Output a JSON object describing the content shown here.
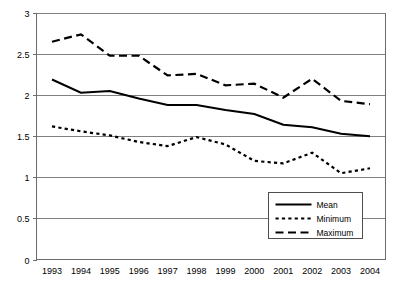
{
  "chart_data": {
    "type": "line",
    "title": "",
    "xlabel": "",
    "ylabel": "",
    "categories": [
      "1993",
      "1994",
      "1995",
      "1996",
      "1997",
      "1998",
      "1999",
      "2000",
      "2001",
      "2002",
      "2003",
      "2004"
    ],
    "x": [
      1993,
      1994,
      1995,
      1996,
      1997,
      1998,
      1999,
      2000,
      2001,
      2002,
      2003,
      2004
    ],
    "ylim": [
      0,
      3
    ],
    "xlim": [
      1993,
      2004
    ],
    "yticks": [
      "0",
      "0.5",
      "1",
      "1.5",
      "2",
      "2.5",
      "3"
    ],
    "ytick_values": [
      0,
      0.5,
      1,
      1.5,
      2,
      2.5,
      3
    ],
    "grid": "horizontal",
    "legend_position": "bottom-right",
    "series": [
      {
        "name": "Mean",
        "style": "solid",
        "color": "#000000",
        "values": [
          2.19,
          2.03,
          2.05,
          1.96,
          1.88,
          1.88,
          1.82,
          1.77,
          1.64,
          1.61,
          1.53,
          1.5
        ]
      },
      {
        "name": "Minimum",
        "style": "dotted",
        "color": "#000000",
        "values": [
          1.62,
          1.56,
          1.51,
          1.43,
          1.38,
          1.49,
          1.4,
          1.2,
          1.17,
          1.3,
          1.05,
          1.11
        ]
      },
      {
        "name": "Maximum",
        "style": "dashed",
        "color": "#000000",
        "values": [
          2.65,
          2.74,
          2.48,
          2.48,
          2.24,
          2.26,
          2.12,
          2.14,
          1.97,
          2.2,
          1.93,
          1.89
        ]
      }
    ]
  },
  "legend": {
    "items": [
      {
        "label": "Mean",
        "style": "solid"
      },
      {
        "label": "Minimum",
        "style": "dotted"
      },
      {
        "label": "Maximum",
        "style": "dashed"
      }
    ]
  },
  "axes": {
    "y_tick_labels": [
      "3",
      "2.5",
      "2",
      "1.5",
      "1",
      "0.5",
      "0"
    ],
    "x_tick_labels": [
      "1993",
      "1994",
      "1995",
      "1996",
      "1997",
      "1998",
      "1999",
      "2000",
      "2001",
      "2002",
      "2003",
      "2004"
    ]
  }
}
